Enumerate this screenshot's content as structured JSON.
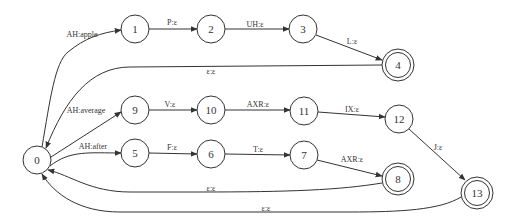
{
  "diagram": {
    "type": "finite-state-transducer",
    "nodes": [
      {
        "id": "0",
        "label": "0",
        "x": 37,
        "y": 160,
        "r": 14,
        "start": true,
        "final": false
      },
      {
        "id": "1",
        "label": "1",
        "x": 135,
        "y": 29,
        "r": 14,
        "final": false
      },
      {
        "id": "2",
        "label": "2",
        "x": 211,
        "y": 29,
        "r": 14,
        "final": false
      },
      {
        "id": "3",
        "label": "3",
        "x": 303,
        "y": 29,
        "r": 14,
        "final": false
      },
      {
        "id": "4",
        "label": "4",
        "x": 398,
        "y": 65,
        "r": 16,
        "final": true
      },
      {
        "id": "9",
        "label": "9",
        "x": 135,
        "y": 110,
        "r": 14,
        "final": false
      },
      {
        "id": "10",
        "label": "10",
        "x": 211,
        "y": 110,
        "r": 14,
        "final": false
      },
      {
        "id": "11",
        "label": "11",
        "x": 304,
        "y": 111,
        "r": 14,
        "final": false
      },
      {
        "id": "12",
        "label": "12",
        "x": 399,
        "y": 119,
        "r": 14,
        "final": false
      },
      {
        "id": "5",
        "label": "5",
        "x": 135,
        "y": 153,
        "r": 14,
        "final": false
      },
      {
        "id": "6",
        "label": "6",
        "x": 211,
        "y": 154,
        "r": 14,
        "final": false
      },
      {
        "id": "7",
        "label": "7",
        "x": 304,
        "y": 155,
        "r": 14,
        "final": false
      },
      {
        "id": "8",
        "label": "8",
        "x": 398,
        "y": 179,
        "r": 16,
        "final": true
      },
      {
        "id": "13",
        "label": "13",
        "x": 477,
        "y": 193,
        "r": 16,
        "final": true
      }
    ],
    "edges": [
      {
        "from": "0",
        "to": "1",
        "label": "AH:apple",
        "lx": 82,
        "ly": 37
      },
      {
        "from": "1",
        "to": "2",
        "label": "P:ε",
        "lx": 172,
        "ly": 25
      },
      {
        "from": "2",
        "to": "3",
        "label": "UH:ε",
        "lx": 255,
        "ly": 27
      },
      {
        "from": "3",
        "to": "4",
        "label": "L:ε",
        "lx": 352,
        "ly": 44
      },
      {
        "from": "4",
        "to": "0",
        "label": "ε:ε",
        "lx": 211,
        "ly": 74
      },
      {
        "from": "0",
        "to": "9",
        "label": "AH:average",
        "lx": 86,
        "ly": 113
      },
      {
        "from": "9",
        "to": "10",
        "label": "V:ε",
        "lx": 170,
        "ly": 107
      },
      {
        "from": "10",
        "to": "11",
        "label": "AXR:ε",
        "lx": 258,
        "ly": 107
      },
      {
        "from": "11",
        "to": "12",
        "label": "IX:ε",
        "lx": 352,
        "ly": 112
      },
      {
        "from": "12",
        "to": "13",
        "label": "J:ε",
        "lx": 438,
        "ly": 150
      },
      {
        "from": "0",
        "to": "5",
        "label": "AH:after",
        "lx": 93,
        "ly": 149
      },
      {
        "from": "5",
        "to": "6",
        "label": "F:ε",
        "lx": 172,
        "ly": 150
      },
      {
        "from": "6",
        "to": "7",
        "label": "T:ε",
        "lx": 258,
        "ly": 152
      },
      {
        "from": "7",
        "to": "8",
        "label": "AXR:ε",
        "lx": 352,
        "ly": 162
      },
      {
        "from": "8",
        "to": "0",
        "label": "ε:ε",
        "lx": 211,
        "ly": 191
      },
      {
        "from": "13",
        "to": "0",
        "label": "ε:ε",
        "lx": 266,
        "ly": 211
      }
    ]
  }
}
